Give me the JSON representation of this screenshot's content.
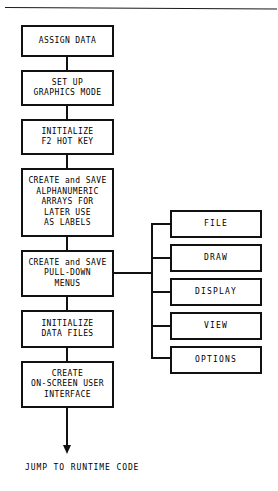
{
  "diagram": {
    "colors": {
      "ink": "#111111",
      "background": "#ffffff",
      "rule": "#1a1a1a"
    },
    "process_steps": [
      {
        "id": "assign-data",
        "label": "ASSIGN DATA"
      },
      {
        "id": "set-up-graphics",
        "label": "SET UP\nGRAPHICS MODE"
      },
      {
        "id": "initialize-hotkey",
        "label": "INITIALIZE\nF2 HOT KEY"
      },
      {
        "id": "create-arrays",
        "label": "CREATE and SAVE\nALPHANUMERIC\nARRAYS FOR\nLATER USE\nAS LABELS"
      },
      {
        "id": "create-menus",
        "label": "CREATE and SAVE\nPULL-DOWN\nMENUS"
      },
      {
        "id": "initialize-files",
        "label": "INITIALIZE\nDATA FILES"
      },
      {
        "id": "create-interface",
        "label": "CREATE\nON-SCREEN USER\nINTERFACE"
      }
    ],
    "menu_items": [
      {
        "id": "file",
        "label": "FILE"
      },
      {
        "id": "draw",
        "label": "DRAW"
      },
      {
        "id": "display",
        "label": "DISPLAY"
      },
      {
        "id": "view",
        "label": "VIEW"
      },
      {
        "id": "options",
        "label": "OPTIONS"
      }
    ],
    "terminator": {
      "label": "JUMP TO RUNTIME CODE"
    }
  }
}
